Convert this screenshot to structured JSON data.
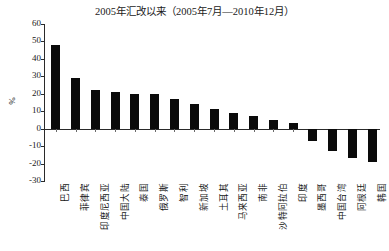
{
  "chart_data": {
    "type": "bar",
    "title": "2005年汇改以来（2005年7月—2010年12月）",
    "xlabel": "",
    "ylabel": "%",
    "ylim": [
      -30,
      60
    ],
    "ytick_labels": [
      "60",
      "50",
      "40",
      "30",
      "20",
      "10",
      "0",
      "-10",
      "-20",
      "-30"
    ],
    "yticks": [
      60,
      50,
      40,
      30,
      20,
      10,
      0,
      -10,
      -20,
      -30
    ],
    "grid": false,
    "legend": null,
    "categories": [
      "巴西",
      "菲律宾",
      "印度尼西亚",
      "中国大陆",
      "泰国",
      "俄罗斯",
      "智利",
      "新加坡",
      "土耳其",
      "马来西亚",
      "南非",
      "沙特阿拉伯",
      "印度",
      "墨西哥",
      "中国台湾",
      "阿根廷",
      "韩国"
    ],
    "values": [
      48,
      29,
      22,
      21,
      20,
      20,
      17,
      14,
      11,
      9,
      7,
      5,
      3,
      -7,
      -13,
      -17,
      -19
    ],
    "bar_color": "#0a0a0a"
  },
  "axis": {
    "y_title": "%"
  }
}
